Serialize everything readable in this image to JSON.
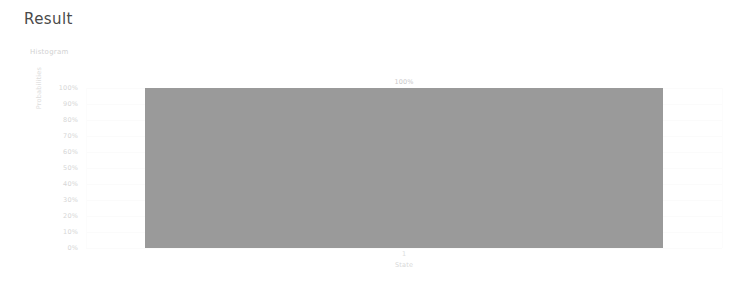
{
  "page": {
    "title": "Result"
  },
  "chart_data": {
    "type": "bar",
    "title": "Histogram",
    "xlabel": "State",
    "ylabel": "Probabilities",
    "categories": [
      "1"
    ],
    "values": [
      100
    ],
    "value_labels": [
      "100%"
    ],
    "ylim": [
      0,
      100
    ],
    "ytick_labels": [
      "100%",
      "90%",
      "80%",
      "70%",
      "60%",
      "50%",
      "40%",
      "30%",
      "20%",
      "10%",
      "0%"
    ],
    "ytick_values": [
      100,
      90,
      80,
      70,
      60,
      50,
      40,
      30,
      20,
      10,
      0
    ],
    "grid": true,
    "legend": false,
    "bar_color": "#9a9a9a",
    "background_color": "#ffffff",
    "text_color": "#d6d6d6"
  }
}
